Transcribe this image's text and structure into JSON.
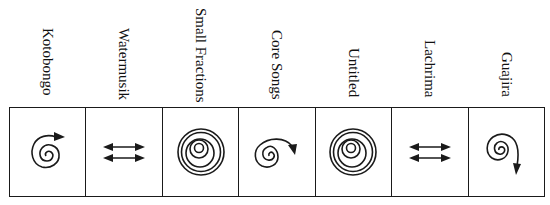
{
  "diagram": {
    "columns": [
      {
        "title": "Kotobongo",
        "symbol": "spiral-arrow-right",
        "label_top": 28
      },
      {
        "title": "Watermusik",
        "symbol": "double-arrows",
        "label_top": 28
      },
      {
        "title": "Small Fractions",
        "symbol": "concentric-circles",
        "label_top": 8
      },
      {
        "title": "Core Songs",
        "symbol": "spiral-arrow-down-right",
        "label_top": 30
      },
      {
        "title": "Untitled",
        "symbol": "concentric-circles",
        "label_top": 48
      },
      {
        "title": "Lachrima",
        "symbol": "double-arrows",
        "label_top": 40
      },
      {
        "title": "Guajira",
        "symbol": "spiral-arrow-down",
        "label_top": 52
      }
    ],
    "line_color": "#1a1a1a"
  }
}
